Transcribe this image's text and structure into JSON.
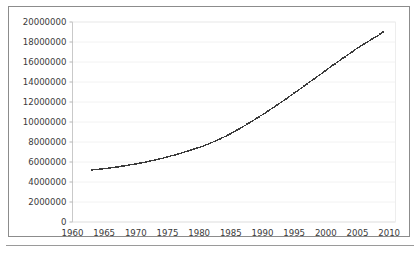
{
  "figure": {
    "frame_color": "#8c8c8c",
    "background": "#ffffff",
    "divider_color": "#9a9a9a"
  },
  "chart_data": {
    "type": "scatter",
    "title": "",
    "subtitle": "",
    "xlabel": "",
    "ylabel": "",
    "xlim": [
      1960,
      2011
    ],
    "ylim": [
      0,
      20000000
    ],
    "grid": true,
    "grid_axis": "y",
    "grid_color": "#f2f2f2",
    "legend": false,
    "legend_position": "none",
    "marker": "dotted-square",
    "marker_color": "#3b3b3b",
    "marker_size": 1.35,
    "x_ticks": [
      1960,
      1965,
      1970,
      1975,
      1980,
      1985,
      1990,
      1995,
      2000,
      2005,
      2010
    ],
    "x_tick_labels": [
      "1960",
      "1965",
      "1970",
      "1975",
      "1980",
      "1985",
      "1990",
      "1995",
      "2000",
      "2005",
      "2010"
    ],
    "y_ticks": [
      0,
      2000000,
      4000000,
      6000000,
      8000000,
      10000000,
      12000000,
      14000000,
      16000000,
      18000000,
      20000000
    ],
    "y_tick_labels": [
      "0",
      "2000000",
      "4000000",
      "6000000",
      "8000000",
      "10000000",
      "12000000",
      "14000000",
      "16000000",
      "18000000",
      "20000000"
    ],
    "x": [
      1963,
      1964,
      1965,
      1966,
      1967,
      1968,
      1969,
      1970,
      1971,
      1972,
      1973,
      1974,
      1975,
      1976,
      1977,
      1978,
      1979,
      1980,
      1981,
      1982,
      1983,
      1984,
      1985,
      1986,
      1987,
      1988,
      1989,
      1990,
      1991,
      1992,
      1993,
      1994,
      1995,
      1996,
      1997,
      1998,
      1999,
      2000,
      2001,
      2002,
      2003,
      2004,
      2005,
      2006,
      2007,
      2008,
      2009
    ],
    "values": [
      5200000,
      5260000,
      5330000,
      5410000,
      5500000,
      5600000,
      5700000,
      5810000,
      5930000,
      6060000,
      6200000,
      6350000,
      6510000,
      6680000,
      6860000,
      7050000,
      7250000,
      7460000,
      7690000,
      7940000,
      8220000,
      8520000,
      8850000,
      9200000,
      9570000,
      9950000,
      10340000,
      10740000,
      11150000,
      11570000,
      12000000,
      12440000,
      12890000,
      13340000,
      13790000,
      14250000,
      14710000,
      15170000,
      15620000,
      16070000,
      16510000,
      16950000,
      17390000,
      17800000,
      18180000,
      18550000,
      19000000
    ]
  }
}
